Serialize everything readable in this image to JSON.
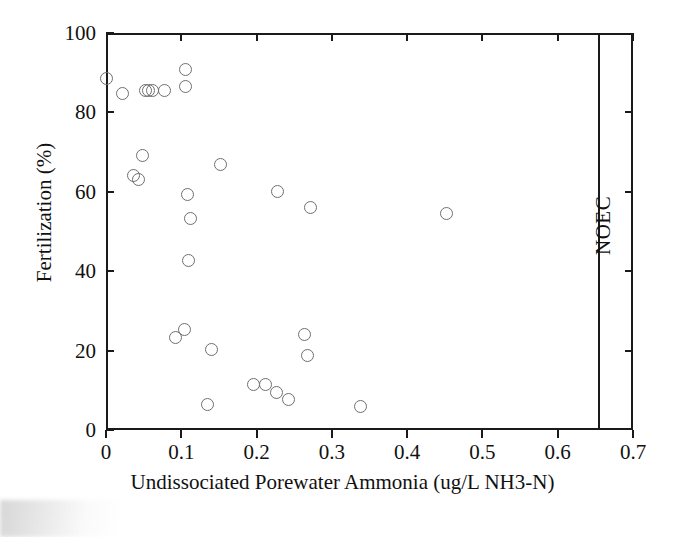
{
  "chart_data": {
    "type": "scatter",
    "title": "",
    "xlabel": "Undissociated Porewater Ammonia (ug/L NH3-N)",
    "ylabel": "Fertilization (%)",
    "xlim": [
      0,
      0.7
    ],
    "ylim": [
      0,
      100
    ],
    "xticks": [
      "0",
      "0.1",
      "0.2",
      "0.3",
      "0.4",
      "0.5",
      "0.6",
      "0.7"
    ],
    "xtick_values": [
      0,
      0.1,
      0.2,
      0.3,
      0.4,
      0.5,
      0.6,
      0.7
    ],
    "yticks": [
      "0",
      "20",
      "40",
      "60",
      "80",
      "100"
    ],
    "ytick_values": [
      0,
      20,
      40,
      60,
      80,
      100
    ],
    "grid": false,
    "legend": "none",
    "marker": "open-circle",
    "marker_color": "#6f6f6f",
    "points": [
      {
        "x": 0.0,
        "y": 88.5
      },
      {
        "x": 0.022,
        "y": 84.8
      },
      {
        "x": 0.052,
        "y": 85.6
      },
      {
        "x": 0.057,
        "y": 85.6
      },
      {
        "x": 0.062,
        "y": 85.6
      },
      {
        "x": 0.078,
        "y": 85.6
      },
      {
        "x": 0.105,
        "y": 90.8
      },
      {
        "x": 0.105,
        "y": 86.6
      },
      {
        "x": 0.048,
        "y": 69.2
      },
      {
        "x": 0.036,
        "y": 64.0
      },
      {
        "x": 0.043,
        "y": 63.0
      },
      {
        "x": 0.108,
        "y": 59.2
      },
      {
        "x": 0.152,
        "y": 66.8
      },
      {
        "x": 0.112,
        "y": 53.4
      },
      {
        "x": 0.228,
        "y": 60.0
      },
      {
        "x": 0.272,
        "y": 56.0
      },
      {
        "x": 0.452,
        "y": 54.6
      },
      {
        "x": 0.11,
        "y": 42.6
      },
      {
        "x": 0.092,
        "y": 23.2
      },
      {
        "x": 0.104,
        "y": 25.2
      },
      {
        "x": 0.14,
        "y": 20.2
      },
      {
        "x": 0.264,
        "y": 24.0
      },
      {
        "x": 0.268,
        "y": 18.8
      },
      {
        "x": 0.196,
        "y": 11.4
      },
      {
        "x": 0.212,
        "y": 11.4
      },
      {
        "x": 0.226,
        "y": 9.4
      },
      {
        "x": 0.242,
        "y": 7.6
      },
      {
        "x": 0.135,
        "y": 6.4
      },
      {
        "x": 0.338,
        "y": 5.8
      }
    ],
    "annotations": [
      {
        "label": "NOEC",
        "type": "vertical-line",
        "x": 0.655,
        "orientation": "rotated"
      }
    ]
  }
}
